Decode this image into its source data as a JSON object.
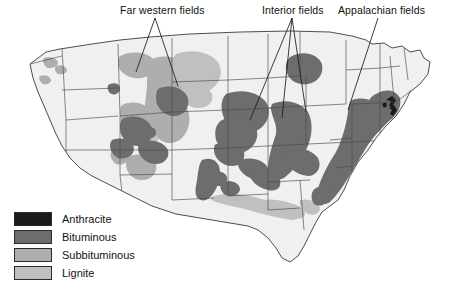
{
  "figure": {
    "kind": "thematic-map",
    "background_color": "#ffffff"
  },
  "callouts": [
    {
      "id": "far-western",
      "label": "Far western fields"
    },
    {
      "id": "interior",
      "label": "Interior fields"
    },
    {
      "id": "appalachian",
      "label": "Appalachian fields"
    }
  ],
  "legend": {
    "items": [
      {
        "label": "Anthracite",
        "color": "#1a1a1a"
      },
      {
        "label": "Bituminous",
        "color": "#6d6d6d"
      },
      {
        "label": "Subbituminous",
        "color": "#aeaeae"
      },
      {
        "label": "Lignite",
        "color": "#c0c0c0"
      }
    ]
  },
  "map_style": {
    "land_fill": "#f0f0f0",
    "state_border": "#4a4a4a",
    "coast_border": "#3a3a3a",
    "leader_line": "#1a1a1a"
  },
  "coal_regions": [
    {
      "name": "Powder River Basin (Wyoming / Montana)",
      "coal_type": "Subbituminous"
    },
    {
      "name": "Williston Basin (North Dakota)",
      "coal_type": "Lignite"
    },
    {
      "name": "Green River / Uinta (Wyoming, Utah, Colorado)",
      "coal_type": "Bituminous"
    },
    {
      "name": "San Juan / Raton (New Mexico, Colorado)",
      "coal_type": "Subbituminous"
    },
    {
      "name": "Illinois Basin (Illinois, Indiana, Kentucky)",
      "coal_type": "Bituminous"
    },
    {
      "name": "Western Interior (Iowa, Missouri, Kansas, Oklahoma)",
      "coal_type": "Bituminous"
    },
    {
      "name": "Appalachian Basin (Pennsylvania to Alabama)",
      "coal_type": "Bituminous"
    },
    {
      "name": "Anthracite field (eastern Pennsylvania)",
      "coal_type": "Anthracite"
    },
    {
      "name": "Gulf Coast (Texas, Louisiana, Mississippi, Alabama)",
      "coal_type": "Lignite"
    },
    {
      "name": "Pacific Northwest scattered fields (Washington)",
      "coal_type": "Subbituminous"
    }
  ]
}
